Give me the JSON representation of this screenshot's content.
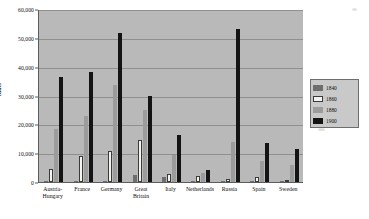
{
  "chart_data": {
    "type": "bar",
    "title": "",
    "xlabel": "",
    "ylabel": "Miles",
    "ylim": [
      0,
      60000
    ],
    "ytick_labels": [
      "0",
      "10,000",
      "20,000",
      "30,000",
      "40,000",
      "50,000",
      "60,000"
    ],
    "ytick_values": [
      0,
      10000,
      20000,
      30000,
      40000,
      50000,
      60000
    ],
    "grid": true,
    "legend_position": "right",
    "categories": [
      "Austria-Hungary",
      "France",
      "Germany",
      "Great Britain",
      "Italy",
      "Netherlands",
      "Russia",
      "Spain",
      "Sweden"
    ],
    "series": [
      {
        "name": "1840",
        "color": "#6e6e6e",
        "values": [
          200,
          300,
          300,
          2400,
          1600,
          100,
          200,
          100,
          200
        ]
      },
      {
        "name": "1860",
        "color": "#f4f4f0",
        "values": [
          4500,
          8900,
          10700,
          14600,
          2800,
          2000,
          1000,
          1900,
          400
        ]
      },
      {
        "name": "1880",
        "color": "#9c9c9c",
        "values": [
          18500,
          23000,
          33800,
          25000,
          9200,
          3100,
          14000,
          7200,
          5800
        ]
      },
      {
        "name": "1900",
        "color": "#141414",
        "values": [
          36300,
          38000,
          51700,
          30000,
          16300,
          4300,
          53200,
          13400,
          11300
        ]
      }
    ]
  },
  "legend": {
    "items": [
      {
        "label": "1840"
      },
      {
        "label": "1860"
      },
      {
        "label": "1880"
      },
      {
        "label": "1900"
      }
    ]
  }
}
